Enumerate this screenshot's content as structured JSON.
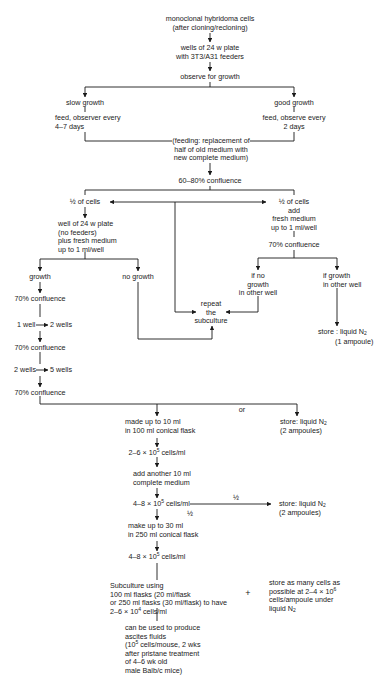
{
  "diagram": {
    "type": "flowchart",
    "nodes": {
      "start": "monoclonal hybridoma cells\n(after cloning/recloning)",
      "wells": "wells of 24 w plate\nwith 3T3/A31 feeders",
      "observe": "observe for growth",
      "slow_growth": "slow growth",
      "slow_feed": "feed, observer every\n4–7 days",
      "good_growth": "good growth",
      "good_feed": "feed, observe every\n2 days",
      "feeding_note": "(feeding: replacement of\nhalf of old medium with\nnew complete medium)",
      "confluence_60_80": "60–80% confluence",
      "half_cells_left": "½ of cells",
      "well_no_feeders": "well of 24 w plate\n(no feeders)\nplus fresh medium\nup to 1 ml/well",
      "half_cells_right": "½ of cells\nadd\nfresh medium\nup to 1 ml/well",
      "confluence_70_right": "70% confluence",
      "growth": "growth",
      "no_growth": "no growth",
      "if_no_growth": "if no\ngrowth\nin other well",
      "if_growth": "if growth\nin other well",
      "repeat": "repeat\nthe\nsubculture",
      "confluence_70_a": "70% confluence",
      "one_to_two_left": "1 well",
      "one_to_two_right": "2 wells",
      "confluence_70_b": "70% confluence",
      "two_to_five_left": "2 wells",
      "two_to_five_right": "5 wells",
      "confluence_70_c": "70% confluence",
      "store_1_ampoule_a": "store : liquid N",
      "store_1_ampoule_sub": "2",
      "store_1_ampoule_b": "(1 ampoule)",
      "or_label": "or",
      "made_up_10": "made up to 10 ml\nin 100 ml conical flask",
      "store_2_ampoules_a": "store: liquid N",
      "store_2_ampoules_sub": "2",
      "store_2_ampoules_b": "(2 ampoules)",
      "conc_2_6_pre": "2–6 × 10",
      "conc_2_6_exp": "5",
      "conc_2_6_post": " cells/ml",
      "add_another": "add another 10 ml\ncomplete medium",
      "conc_4_8_pre": "4–8 × 10",
      "conc_4_8_exp": "5",
      "conc_4_8_post": " cells/ml",
      "half_right_label": "½",
      "half_down_label": "½",
      "store_2_ampoules2_a": "store: liquid N",
      "store_2_ampoules2_sub": "2",
      "store_2_ampoules2_b": "(2 ampoules)",
      "make_up_30": "make up to 30 ml\nin 250 ml conical flask",
      "conc_4_8b_pre": "4–8 × 10",
      "conc_4_8b_exp": "5",
      "conc_4_8b_post": " cells/ml",
      "subculture_1": "Subculture using\n100 ml flasks (20 ml/flask\nor 250 ml flasks (30 ml/flask) to have",
      "subculture_2_pre": "2–6 × 10",
      "subculture_2_exp": "4",
      "subculture_2_post": " cells/ml",
      "plus_sign": "+",
      "store_many_1": "store as many cells as",
      "store_many_2_pre": "possible at 2–4 × 10",
      "store_many_2_exp": "6",
      "store_many_3": "cells/ampoule under",
      "store_many_4_pre": "liquid N",
      "store_many_4_sub": "2",
      "ascites_1": "can be used to produce\nascites fluids",
      "ascites_2_pre": "(10",
      "ascites_2_exp": "5",
      "ascites_2_post": " cells/mouse, 2 wks",
      "ascites_3": "after pristane treatment\nof 4–6 wk old\nmale Balb/c mice)"
    },
    "colors": {
      "line": "#1a1a1a",
      "text": "#1a1a1a",
      "background": "#ffffff"
    }
  }
}
